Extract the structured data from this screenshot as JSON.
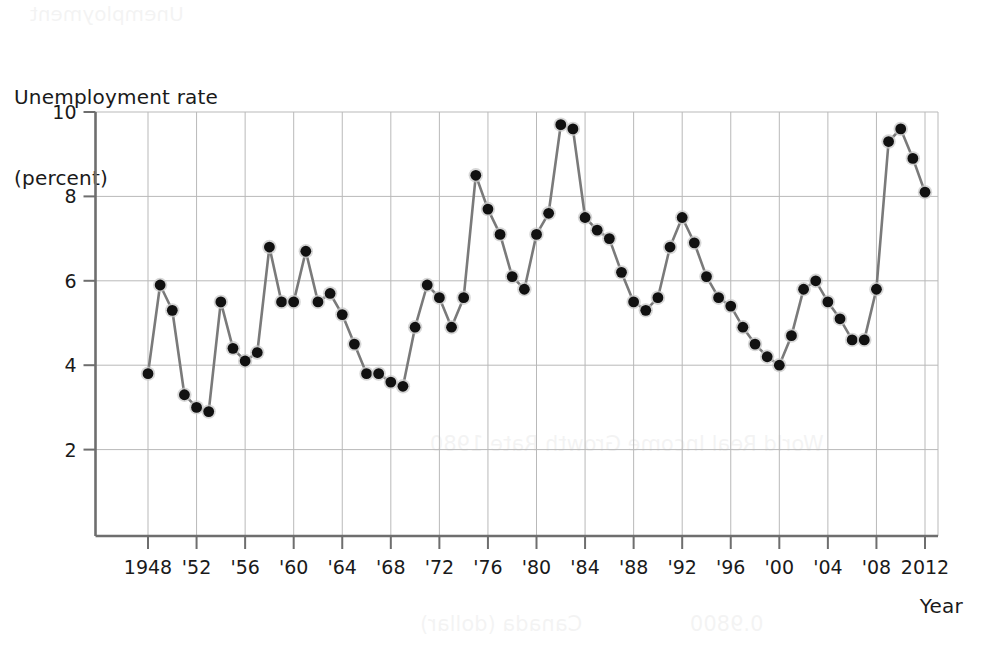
{
  "chart_data": {
    "type": "line",
    "title": "",
    "ylabel_lines": [
      "Unemployment rate",
      "(percent)"
    ],
    "xlabel": "Year",
    "ylim": [
      0,
      10
    ],
    "yticks": [
      2,
      4,
      6,
      8,
      10
    ],
    "ytick_labels": [
      "2",
      "4",
      "6",
      "8",
      "10"
    ],
    "xlim": [
      1947.2,
      2012.8
    ],
    "xticks": [
      1948,
      1952,
      1956,
      1960,
      1964,
      1968,
      1972,
      1976,
      1980,
      1984,
      1988,
      1992,
      1996,
      2000,
      2004,
      2008,
      2012
    ],
    "xtick_labels": [
      "1948",
      "'52",
      "'56",
      "'60",
      "'64",
      "'68",
      "'72",
      "'76",
      "'80",
      "'84",
      "'88",
      "'92",
      "'96",
      "'00",
      "'04",
      "'08",
      "2012"
    ],
    "grid": true,
    "legend": "none",
    "marker": "filled-circle",
    "line_color": "#7a7a7a",
    "marker_color": "#111111",
    "grid_color": "#b9b9b9",
    "axis_color": "#6e6e6e",
    "x": [
      1948,
      1949,
      1950,
      1951,
      1952,
      1953,
      1954,
      1955,
      1956,
      1957,
      1958,
      1959,
      1960,
      1961,
      1962,
      1963,
      1964,
      1965,
      1966,
      1967,
      1968,
      1969,
      1970,
      1971,
      1972,
      1973,
      1974,
      1975,
      1976,
      1977,
      1978,
      1979,
      1980,
      1981,
      1982,
      1983,
      1984,
      1985,
      1986,
      1987,
      1988,
      1989,
      1990,
      1991,
      1992,
      1993,
      1994,
      1995,
      1996,
      1997,
      1998,
      1999,
      2000,
      2001,
      2002,
      2003,
      2004,
      2005,
      2006,
      2007,
      2008,
      2009,
      2010,
      2011,
      2012
    ],
    "values": [
      3.8,
      5.9,
      5.3,
      3.3,
      3.0,
      2.9,
      5.5,
      4.4,
      4.1,
      4.3,
      6.8,
      5.5,
      5.5,
      6.7,
      5.5,
      5.7,
      5.2,
      4.5,
      3.8,
      3.8,
      3.6,
      3.5,
      4.9,
      5.9,
      5.6,
      4.9,
      5.6,
      8.5,
      7.7,
      7.1,
      6.1,
      5.8,
      7.1,
      7.6,
      9.7,
      9.6,
      7.5,
      7.2,
      7.0,
      6.2,
      5.5,
      5.3,
      5.6,
      6.8,
      7.5,
      6.9,
      6.1,
      5.6,
      5.4,
      4.9,
      4.5,
      4.2,
      4.0,
      4.7,
      5.8,
      6.0,
      5.5,
      5.1,
      4.6,
      4.6,
      5.8,
      9.3,
      9.6,
      8.9,
      8.1
    ]
  },
  "bleed_text": [
    {
      "text": "Unemployment",
      "left": 30,
      "top": 2,
      "size": 20
    },
    {
      "text": "World Real Income Growth Rate 1980",
      "left": 430,
      "top": 432,
      "size": 21
    },
    {
      "text": "Canada (dollar)",
      "left": 420,
      "top": 612,
      "size": 21
    },
    {
      "text": "0.9800",
      "left": 690,
      "top": 612,
      "size": 21
    }
  ]
}
